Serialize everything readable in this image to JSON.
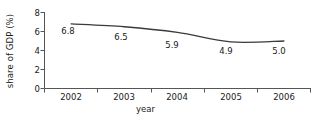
{
  "chart_data": {
    "type": "line",
    "title": "",
    "xlabel": "year",
    "ylabel": "share of GDP (%)",
    "categories": [
      "2002",
      "2003",
      "2004",
      "2005",
      "2006"
    ],
    "values": [
      6.8,
      6.5,
      5.9,
      4.9,
      5.0
    ],
    "point_labels": [
      "6.8",
      "6.5",
      "5.9",
      "4.9",
      "5.0"
    ],
    "series": [
      {
        "name": "share of GDP",
        "values": [
          6.8,
          6.5,
          5.9,
          4.9,
          5.0
        ]
      }
    ],
    "ylim": [
      0,
      8
    ],
    "yticks": [
      0,
      2,
      4,
      6,
      8
    ],
    "ytick_labels": [
      "0",
      "2",
      "4",
      "6",
      "8"
    ],
    "xtick_labels": [
      "2002",
      "2003",
      "2004",
      "2005",
      "2006"
    ],
    "grid": false,
    "legend": false,
    "line_color": "#3a3a3a",
    "axis_color": "#555555",
    "text_color": "#1a1a1a",
    "background": "#ffffff"
  }
}
